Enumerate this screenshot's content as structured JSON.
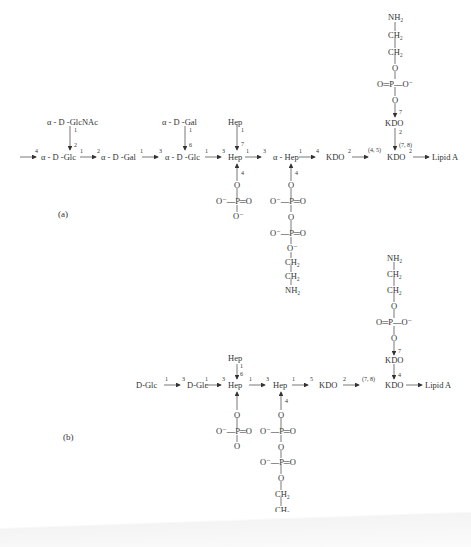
{
  "figure": {
    "panel_a": {
      "label": "(a)",
      "main_chain": [
        "α - D -Glc",
        "α - D -Gal",
        "α - D -Glc",
        "Hep",
        "α - Hep",
        "KDO",
        "KDO",
        "Lipid A"
      ],
      "link_labels": {
        "in": "4",
        "glc1_out": "1",
        "gal_in": "2",
        "gal_out": "1",
        "glc2_in": "3",
        "glc2_out": "1",
        "hep_in": "3",
        "hep_out": "1",
        "ahep_in": "3",
        "ahep_out": "1",
        "kdo1_in": "4",
        "kdo1_out": "2",
        "kdo2_in": "(4, 5)",
        "kdo2_out": "2",
        "kdo_branch_top_in": "7",
        "kdo_branch_top_out": "2",
        "kdo2_top_in": "(7, 8)"
      },
      "branches": {
        "glcnac": {
          "name": "α - D -GlcNAc",
          "from": "1",
          "to": "2"
        },
        "gal": {
          "name": "α - D -Gal",
          "from": "1",
          "to": "6"
        },
        "hep": {
          "name": "Hep",
          "from": "1",
          "to": "7"
        },
        "hep_phosphate": {
          "pos": "4",
          "O": "O",
          "P": "O⁻—P═O",
          "O2": "O⁻"
        },
        "ahep_ppea": {
          "pos": "4",
          "O": "O",
          "P1": "O⁻—P═O",
          "O_mid": "O",
          "P2": "O⁻—P═O",
          "O3": "O⁻",
          "CH2a": "CH₂",
          "CH2b": "CH₂",
          "NH2": "NH₂"
        },
        "kdo_pea": {
          "NH2": "NH₂",
          "CH2a": "CH₂",
          "CH2b": "CH₂",
          "O": "O",
          "P": "O═P—O⁻",
          "O2": "O",
          "KDO": "KDO"
        }
      }
    },
    "panel_b": {
      "label": "(b)",
      "main_chain": [
        "D-Glc",
        "D-Glc",
        "Hep",
        "Hep",
        "KDO",
        "KDO",
        "Lipid A"
      ],
      "link_labels": {
        "glc1_out": "1",
        "glc2_in": "3",
        "glc2_out": "1",
        "hep_in": "3",
        "hep_out": "1",
        "hep2_in": "3",
        "hep2_out": "1",
        "kdo1_in": "5",
        "kdo1_out": "2",
        "kdo2_in": "(7, 8)",
        "kdo_top_in": "7",
        "kdo_top_to_kdo2": "4"
      },
      "branches": {
        "hep": {
          "name": "Hep",
          "from": "1",
          "to": "6"
        },
        "hep_phosphate": {
          "O": "O",
          "P": "O⁻—P═O",
          "O2": "O"
        },
        "hep2_ppea": {
          "pos": "4",
          "O": "O",
          "P1": "O⁻—P═O",
          "O_mid": "O",
          "P2": "O⁻—P═O",
          "O3": "O",
          "CH2a": "CH₂",
          "CH2b": "CH₂",
          "NH2": "NH₂"
        },
        "kdo_pea": {
          "NH2": "NH₂",
          "CH2a": "CH₂",
          "CH2b": "CH₂",
          "O": "O",
          "P": "O═P—O⁻",
          "O2": "O",
          "KDO": "KDO"
        }
      }
    }
  }
}
